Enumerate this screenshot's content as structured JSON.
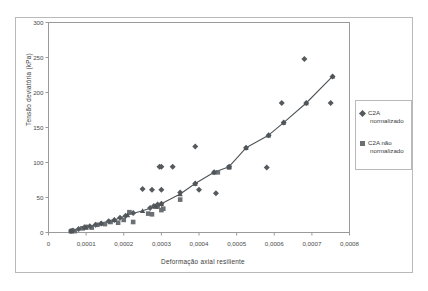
{
  "chart_data": {
    "type": "scatter",
    "title": "",
    "xlabel": "Deformação axial resiliente",
    "ylabel": "Tensão deviatória (kPa)",
    "xlim": [
      0,
      0.0008
    ],
    "ylim": [
      0,
      300
    ],
    "grid": false,
    "legend_position": "right",
    "xticks": [
      "0",
      "0,0001",
      "0,0002",
      "0,0003",
      "0,0004",
      "0,0005",
      "0,0006",
      "0,0007",
      "0,0008"
    ],
    "xtick_values": [
      0,
      0.0001,
      0.0002,
      0.0003,
      0.0004,
      0.0005,
      0.0006,
      0.0007,
      0.0008
    ],
    "yticks": [
      "0",
      "50",
      "100",
      "150",
      "200",
      "250",
      "300"
    ],
    "ytick_values": [
      0,
      50,
      100,
      150,
      200,
      250,
      300
    ],
    "series": [
      {
        "name": "C2A normalizado",
        "marker": "diamond",
        "color": "#555a5e",
        "points": [
          [
            6e-05,
            2
          ],
          [
            6.5e-05,
            3
          ],
          [
            8e-05,
            5
          ],
          [
            9.5e-05,
            7
          ],
          [
            0.00011,
            9
          ],
          [
            0.000125,
            11
          ],
          [
            0.00014,
            13
          ],
          [
            0.00016,
            16
          ],
          [
            0.000175,
            18
          ],
          [
            0.00019,
            21
          ],
          [
            0.000205,
            24
          ],
          [
            0.000225,
            28
          ],
          [
            0.00025,
            62
          ],
          [
            0.00027,
            35
          ],
          [
            0.00028,
            38
          ],
          [
            0.00029,
            40
          ],
          [
            0.000295,
            94
          ],
          [
            0.0003,
            94
          ],
          [
            0.0003,
            41
          ],
          [
            0.0003,
            61
          ],
          [
            0.000275,
            61
          ],
          [
            0.00033,
            94
          ],
          [
            0.00035,
            57
          ],
          [
            0.00039,
            123
          ],
          [
            0.00039,
            70
          ],
          [
            0.0004,
            61
          ],
          [
            0.00044,
            86
          ],
          [
            0.000445,
            56
          ],
          [
            0.00048,
            94
          ],
          [
            0.000525,
            121
          ],
          [
            0.00058,
            93
          ],
          [
            0.000585,
            139
          ],
          [
            0.00062,
            185
          ],
          [
            0.000625,
            157
          ],
          [
            0.00068,
            248
          ],
          [
            0.000685,
            185
          ],
          [
            0.00075,
            185
          ],
          [
            0.000755,
            223
          ]
        ]
      },
      {
        "name": "C2A não normalizado",
        "marker": "square",
        "color": "#6b7075",
        "points": [
          [
            6e-05,
            2
          ],
          [
            7e-05,
            2
          ],
          [
            9e-05,
            6
          ],
          [
            0.0001,
            8
          ],
          [
            0.000115,
            7
          ],
          [
            0.00013,
            11
          ],
          [
            0.00015,
            12
          ],
          [
            0.000165,
            15
          ],
          [
            0.000185,
            14
          ],
          [
            0.0002,
            18
          ],
          [
            0.000215,
            29
          ],
          [
            0.000225,
            15
          ],
          [
            0.000265,
            27
          ],
          [
            0.000275,
            26
          ],
          [
            0.00029,
            37
          ],
          [
            0.0003,
            32
          ],
          [
            0.000305,
            34
          ],
          [
            0.00035,
            47
          ],
          [
            0.00045,
            86
          ],
          [
            0.00048,
            93
          ]
        ]
      }
    ],
    "fit_curve": {
      "name": "fitted-curve",
      "marker": "triangle",
      "color": "#4e5458",
      "points": [
        [
          6e-05,
          2
        ],
        [
          0.0001,
          7
        ],
        [
          0.00014,
          13
        ],
        [
          0.000175,
          18
        ],
        [
          0.00021,
          25
        ],
        [
          0.00025,
          31
        ],
        [
          0.000285,
          37
        ],
        [
          0.0003,
          41
        ],
        [
          0.00035,
          55
        ],
        [
          0.00039,
          70
        ],
        [
          0.00044,
          86
        ],
        [
          0.00048,
          94
        ],
        [
          0.000525,
          121
        ],
        [
          0.000585,
          139
        ],
        [
          0.000625,
          157
        ],
        [
          0.000685,
          185
        ],
        [
          0.000755,
          223
        ]
      ]
    }
  },
  "legend": {
    "items": [
      {
        "label_line1": "C2A",
        "label_line2": "normalizado",
        "marker": "diamond"
      },
      {
        "label_line1": "C2A não",
        "label_line2": "normalizado",
        "marker": "square"
      }
    ]
  }
}
